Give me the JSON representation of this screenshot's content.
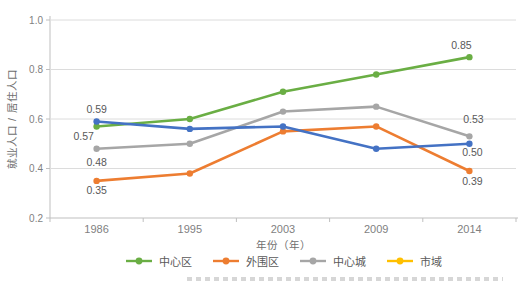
{
  "chart_data": {
    "type": "line",
    "title": "",
    "categories": [
      "1986",
      "1995",
      "2003",
      "2009",
      "2014"
    ],
    "xlabel": "年份（年）",
    "ylabel": "就业人口 / 居住人口",
    "ylim": [
      0.2,
      1.0
    ],
    "yticks": [
      1.0,
      0.8,
      0.6,
      0.4,
      0.2
    ],
    "grid": true,
    "legend_position": "bottom",
    "series": [
      {
        "name": "中心区",
        "line_color": "#6AAE44",
        "legend_color": "#6AAE44",
        "values": [
          0.57,
          0.6,
          0.71,
          0.78,
          0.85
        ],
        "first_label": "0.57",
        "last_label": "0.85"
      },
      {
        "name": "外围区",
        "line_color": "#ED7D31",
        "legend_color": "#ED7D31",
        "values": [
          0.35,
          0.38,
          0.55,
          0.57,
          0.39
        ],
        "first_label": "0.35",
        "last_label": "0.39"
      },
      {
        "name": "中心城",
        "line_color": "#A6A6A6",
        "legend_color": "#A6A6A6",
        "values": [
          0.48,
          0.5,
          0.63,
          0.65,
          0.53
        ],
        "first_label": "0.48",
        "last_label": "0.53"
      },
      {
        "name": "市域",
        "line_color": "#4472C4",
        "legend_color": "#FFC000",
        "values": [
          0.59,
          0.56,
          0.57,
          0.48,
          0.5
        ],
        "first_label": "0.59",
        "last_label": "0.50"
      }
    ],
    "colors": {
      "grid": "#DCDCDC",
      "axis": "#BFBFBF",
      "tick_text": "#7F7F7F",
      "value_label_text": "#595959",
      "legend_text": "#595959"
    }
  }
}
